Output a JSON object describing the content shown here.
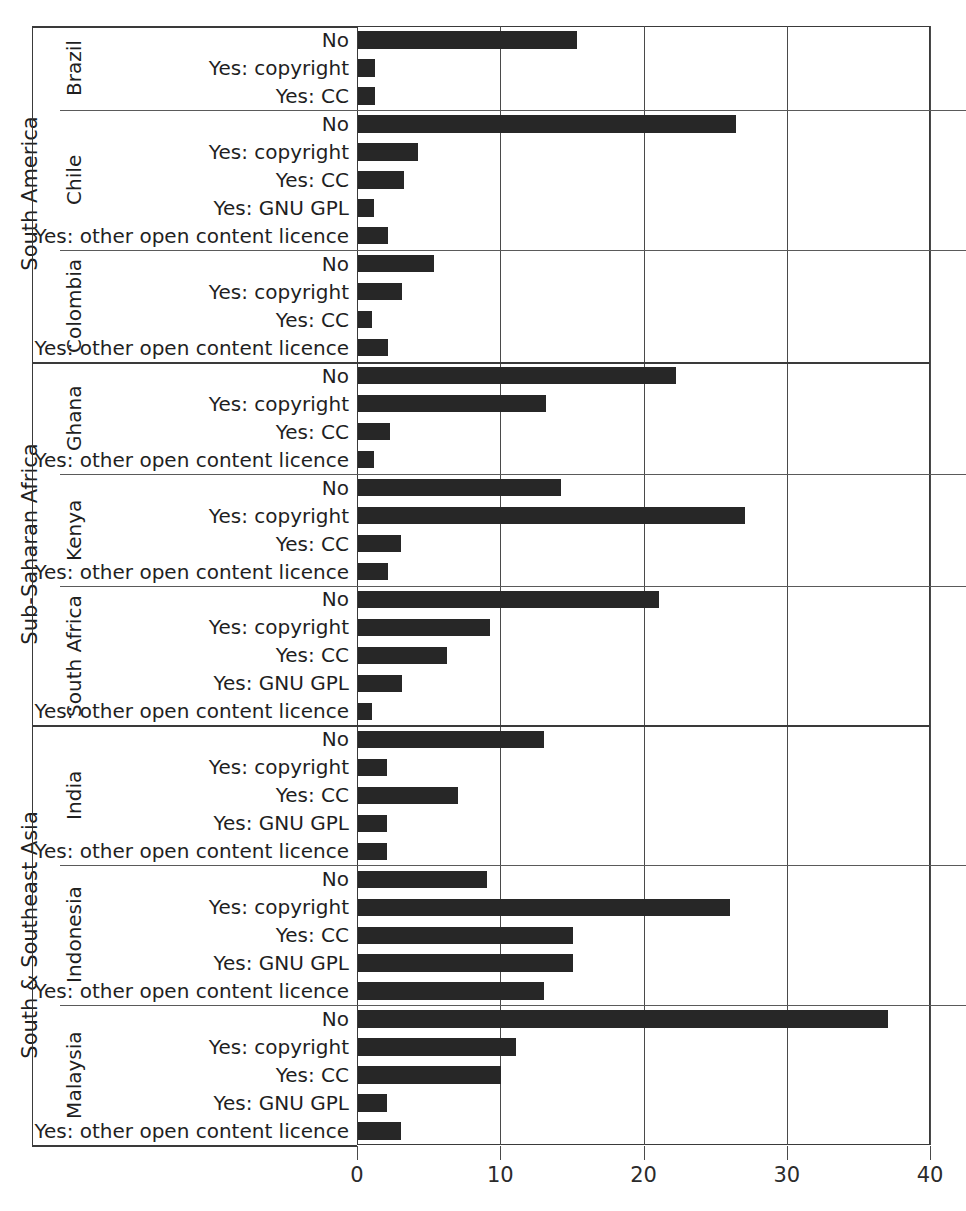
{
  "chart_data": {
    "type": "bar",
    "orientation": "horizontal",
    "title": "",
    "xlabel": "",
    "ylabel": "",
    "xlim": [
      0,
      40
    ],
    "xticks": [
      0,
      10,
      20,
      30,
      40
    ],
    "xtick_labels": [
      "0",
      "10",
      "20",
      "30",
      "40"
    ],
    "grid": true,
    "legend": "none",
    "bar_color": "#272727",
    "categories": [
      "No",
      "Yes: copyright",
      "Yes: CC",
      "Yes: GNU GPL",
      "Yes: other open content licence"
    ],
    "regions": [
      {
        "name": "South America",
        "countries": [
          {
            "name": "Brazil",
            "items": [
              {
                "label": "No",
                "value": 15.3
              },
              {
                "label": "Yes: copyright",
                "value": 1.2
              },
              {
                "label": "Yes: CC",
                "value": 1.2
              }
            ]
          },
          {
            "name": "Chile",
            "items": [
              {
                "label": "No",
                "value": 26.4
              },
              {
                "label": "Yes: copyright",
                "value": 4.2
              },
              {
                "label": "Yes: CC",
                "value": 3.2
              },
              {
                "label": "Yes: GNU GPL",
                "value": 1.1
              },
              {
                "label": "Yes: other open content licence",
                "value": 2.1
              }
            ]
          },
          {
            "name": "Colombia",
            "items": [
              {
                "label": "No",
                "value": 5.3
              },
              {
                "label": "Yes: copyright",
                "value": 3.1
              },
              {
                "label": "Yes: CC",
                "value": 1.0
              },
              {
                "label": "Yes: other open content licence",
                "value": 2.1
              }
            ]
          }
        ]
      },
      {
        "name": "Sub-Saharan Africa",
        "countries": [
          {
            "name": "Ghana",
            "items": [
              {
                "label": "No",
                "value": 22.2
              },
              {
                "label": "Yes: copyright",
                "value": 13.1
              },
              {
                "label": "Yes: CC",
                "value": 2.2
              },
              {
                "label": "Yes: other open content licence",
                "value": 1.1
              }
            ]
          },
          {
            "name": "Kenya",
            "items": [
              {
                "label": "No",
                "value": 14.2
              },
              {
                "label": "Yes: copyright",
                "value": 27.0
              },
              {
                "label": "Yes: CC",
                "value": 3.0
              },
              {
                "label": "Yes: other open content licence",
                "value": 2.1
              }
            ]
          },
          {
            "name": "South Africa",
            "items": [
              {
                "label": "No",
                "value": 21.0
              },
              {
                "label": "Yes: copyright",
                "value": 9.2
              },
              {
                "label": "Yes: CC",
                "value": 6.2
              },
              {
                "label": "Yes: GNU GPL",
                "value": 3.1
              },
              {
                "label": "Yes: other open content licence",
                "value": 1.0
              }
            ]
          }
        ]
      },
      {
        "name": "South & Southeast Asia",
        "countries": [
          {
            "name": "India",
            "items": [
              {
                "label": "No",
                "value": 13.0
              },
              {
                "label": "Yes: copyright",
                "value": 2.0
              },
              {
                "label": "Yes: CC",
                "value": 7.0
              },
              {
                "label": "Yes: GNU GPL",
                "value": 2.0
              },
              {
                "label": "Yes: other open content licence",
                "value": 2.0
              }
            ]
          },
          {
            "name": "Indonesia",
            "items": [
              {
                "label": "No",
                "value": 9.0
              },
              {
                "label": "Yes: copyright",
                "value": 26.0
              },
              {
                "label": "Yes: CC",
                "value": 15.0
              },
              {
                "label": "Yes: GNU GPL",
                "value": 15.0
              },
              {
                "label": "Yes: other open content licence",
                "value": 13.0
              }
            ]
          },
          {
            "name": "Malaysia",
            "items": [
              {
                "label": "No",
                "value": 37.0
              },
              {
                "label": "Yes: copyright",
                "value": 11.0
              },
              {
                "label": "Yes: CC",
                "value": 10.0
              },
              {
                "label": "Yes: GNU GPL",
                "value": 2.0
              },
              {
                "label": "Yes: other open content licence",
                "value": 3.0
              }
            ]
          }
        ]
      }
    ]
  }
}
